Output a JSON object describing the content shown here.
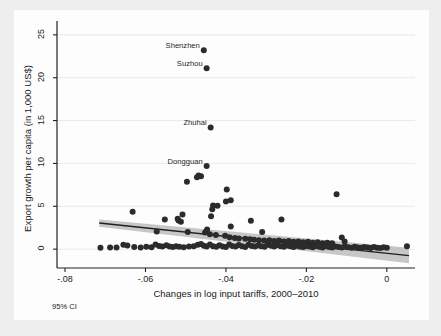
{
  "figure": {
    "background_color": "#eeeeee",
    "canvas_color": "#fdfdfd",
    "note": "95% CI"
  },
  "chart_data": {
    "type": "scatter",
    "title": "",
    "subtitle": "",
    "xlabel": "Changes in log input tariffs, 2000–2010",
    "ylabel": "Export growth per capita (in 1,000 US$)",
    "xlim": [
      -0.082,
      0.007
    ],
    "ylim": [
      -2.2,
      26.5
    ],
    "xticks": [
      -0.08,
      -0.06,
      -0.04,
      -0.02,
      0
    ],
    "xticklabels": [
      "-.08",
      "-.06",
      "-.04",
      "-.02",
      "0"
    ],
    "yticks": [
      0,
      5,
      10,
      15,
      20,
      25
    ],
    "yticklabels": [
      "0",
      "5",
      "10",
      "15",
      "20",
      "25"
    ],
    "grid": "horizontal",
    "legend": "none",
    "marker_color": "#2b2b2b",
    "marker_size": 3.0,
    "fit_line_color": "#1f1f1f",
    "ci_band_color": "#9a9a9a",
    "ci_level": "95% CI",
    "fit_line": {
      "x_start": -0.0715,
      "y_start": 3.05,
      "x_end": 0.0055,
      "y_end": -0.75
    },
    "ci_band": {
      "x_start": -0.0715,
      "upper_start": 3.45,
      "lower_start": 2.6,
      "x_end": 0.0055,
      "upper_end": 0.15,
      "lower_end": -1.65
    },
    "annotations": [
      {
        "label": "Shenzhen",
        "x": -0.0455,
        "y": 23.2
      },
      {
        "label": "Suzhou",
        "x": -0.0448,
        "y": 21.1
      },
      {
        "label": "Zhuhai",
        "x": -0.0438,
        "y": 14.2
      },
      {
        "label": "Dongguan",
        "x": -0.0448,
        "y": 9.7
      }
    ],
    "points": [
      {
        "x": -0.0455,
        "y": 23.2
      },
      {
        "x": -0.0448,
        "y": 21.1
      },
      {
        "x": -0.0438,
        "y": 14.2
      },
      {
        "x": -0.0448,
        "y": 9.7
      },
      {
        "x": -0.0468,
        "y": 8.6
      },
      {
        "x": -0.0472,
        "y": 8.4
      },
      {
        "x": -0.0462,
        "y": 8.5
      },
      {
        "x": -0.0497,
        "y": 7.85
      },
      {
        "x": -0.0398,
        "y": 6.95
      },
      {
        "x": -0.0125,
        "y": 6.4
      },
      {
        "x": -0.0388,
        "y": 5.7
      },
      {
        "x": -0.04,
        "y": 5.55
      },
      {
        "x": -0.0432,
        "y": 5.1
      },
      {
        "x": -0.0421,
        "y": 5.05
      },
      {
        "x": -0.0434,
        "y": 4.65
      },
      {
        "x": -0.0632,
        "y": 4.35
      },
      {
        "x": -0.0508,
        "y": 4.05
      },
      {
        "x": -0.0437,
        "y": 3.85
      },
      {
        "x": -0.0338,
        "y": 3.3
      },
      {
        "x": -0.0262,
        "y": 3.45
      },
      {
        "x": -0.0552,
        "y": 3.45
      },
      {
        "x": -0.0518,
        "y": 3.35
      },
      {
        "x": -0.0512,
        "y": 3.2
      },
      {
        "x": -0.052,
        "y": 3.55
      },
      {
        "x": -0.0388,
        "y": 2.65
      },
      {
        "x": -0.031,
        "y": 2.0
      },
      {
        "x": -0.0572,
        "y": 2.05
      },
      {
        "x": -0.0495,
        "y": 2.0
      },
      {
        "x": -0.0447,
        "y": 2.3
      },
      {
        "x": -0.0452,
        "y": 1.95
      },
      {
        "x": -0.044,
        "y": 1.75
      },
      {
        "x": -0.0425,
        "y": 1.65
      },
      {
        "x": -0.0402,
        "y": 1.55
      },
      {
        "x": -0.0391,
        "y": 1.4
      },
      {
        "x": -0.0378,
        "y": 1.3
      },
      {
        "x": -0.0368,
        "y": 1.25
      },
      {
        "x": -0.0352,
        "y": 1.2
      },
      {
        "x": -0.034,
        "y": 1.15
      },
      {
        "x": -0.033,
        "y": 1.1
      },
      {
        "x": -0.0318,
        "y": 1.05
      },
      {
        "x": -0.0305,
        "y": 1.0
      },
      {
        "x": -0.0292,
        "y": 1.05
      },
      {
        "x": -0.028,
        "y": 0.95
      },
      {
        "x": -0.0268,
        "y": 1.0
      },
      {
        "x": -0.0256,
        "y": 0.9
      },
      {
        "x": -0.0244,
        "y": 0.95
      },
      {
        "x": -0.0232,
        "y": 0.85
      },
      {
        "x": -0.022,
        "y": 0.9
      },
      {
        "x": -0.0208,
        "y": 0.8
      },
      {
        "x": -0.0196,
        "y": 0.85
      },
      {
        "x": -0.0184,
        "y": 0.75
      },
      {
        "x": -0.0172,
        "y": 0.8
      },
      {
        "x": -0.016,
        "y": 0.7
      },
      {
        "x": -0.0148,
        "y": 0.75
      },
      {
        "x": -0.0136,
        "y": 0.7
      },
      {
        "x": -0.0112,
        "y": 1.35
      },
      {
        "x": -0.0105,
        "y": 0.9
      },
      {
        "x": -0.0712,
        "y": 0.15
      },
      {
        "x": -0.0688,
        "y": 0.18
      },
      {
        "x": -0.0672,
        "y": 0.2
      },
      {
        "x": -0.0655,
        "y": 0.5
      },
      {
        "x": -0.0645,
        "y": 0.42
      },
      {
        "x": -0.0628,
        "y": 0.25
      },
      {
        "x": -0.0612,
        "y": 0.2
      },
      {
        "x": -0.0598,
        "y": 0.28
      },
      {
        "x": -0.0585,
        "y": 0.22
      },
      {
        "x": -0.0575,
        "y": 0.55
      },
      {
        "x": -0.0566,
        "y": 0.38
      },
      {
        "x": -0.0558,
        "y": 0.3
      },
      {
        "x": -0.0548,
        "y": 0.45
      },
      {
        "x": -0.054,
        "y": 0.32
      },
      {
        "x": -0.0532,
        "y": 0.25
      },
      {
        "x": -0.0524,
        "y": 0.35
      },
      {
        "x": -0.0516,
        "y": 0.28
      },
      {
        "x": -0.0505,
        "y": 0.22
      },
      {
        "x": -0.0492,
        "y": 0.3
      },
      {
        "x": -0.048,
        "y": 0.35
      },
      {
        "x": -0.047,
        "y": 0.5
      },
      {
        "x": -0.0462,
        "y": 0.6
      },
      {
        "x": -0.0455,
        "y": 0.4
      },
      {
        "x": -0.0448,
        "y": 0.3
      },
      {
        "x": -0.044,
        "y": 0.55
      },
      {
        "x": -0.0432,
        "y": 0.35
      },
      {
        "x": -0.0424,
        "y": 0.28
      },
      {
        "x": -0.0416,
        "y": 0.45
      },
      {
        "x": -0.0408,
        "y": 0.32
      },
      {
        "x": -0.04,
        "y": 0.25
      },
      {
        "x": -0.0392,
        "y": 0.55
      },
      {
        "x": -0.0384,
        "y": 0.38
      },
      {
        "x": -0.0376,
        "y": 0.3
      },
      {
        "x": -0.0368,
        "y": 0.48
      },
      {
        "x": -0.036,
        "y": 0.35
      },
      {
        "x": -0.0352,
        "y": 0.25
      },
      {
        "x": -0.0344,
        "y": 0.52
      },
      {
        "x": -0.0336,
        "y": 0.38
      },
      {
        "x": -0.0328,
        "y": 0.3
      },
      {
        "x": -0.032,
        "y": 0.42
      },
      {
        "x": -0.0312,
        "y": 0.35
      },
      {
        "x": -0.0304,
        "y": 0.28
      },
      {
        "x": -0.0296,
        "y": 0.5
      },
      {
        "x": -0.0288,
        "y": 0.4
      },
      {
        "x": -0.028,
        "y": 0.32
      },
      {
        "x": -0.0272,
        "y": 0.45
      },
      {
        "x": -0.0264,
        "y": 0.35
      },
      {
        "x": -0.0256,
        "y": 0.28
      },
      {
        "x": -0.0248,
        "y": 0.42
      },
      {
        "x": -0.024,
        "y": 0.33
      },
      {
        "x": -0.0232,
        "y": 0.26
      },
      {
        "x": -0.0224,
        "y": 0.4
      },
      {
        "x": -0.0216,
        "y": 0.3
      },
      {
        "x": -0.0208,
        "y": 0.24
      },
      {
        "x": -0.02,
        "y": 0.38
      },
      {
        "x": -0.0192,
        "y": 0.3
      },
      {
        "x": -0.0184,
        "y": 0.22
      },
      {
        "x": -0.0176,
        "y": 0.36
      },
      {
        "x": -0.0168,
        "y": 0.28
      },
      {
        "x": -0.016,
        "y": 0.2
      },
      {
        "x": -0.0152,
        "y": 0.34
      },
      {
        "x": -0.0144,
        "y": 0.26
      },
      {
        "x": -0.0136,
        "y": 0.2
      },
      {
        "x": -0.0128,
        "y": 0.32
      },
      {
        "x": -0.012,
        "y": 0.25
      },
      {
        "x": -0.0112,
        "y": 0.18
      },
      {
        "x": -0.0104,
        "y": 0.3
      },
      {
        "x": -0.0096,
        "y": 0.22
      },
      {
        "x": -0.0088,
        "y": 0.16
      },
      {
        "x": -0.008,
        "y": 0.28
      },
      {
        "x": -0.0072,
        "y": 0.2
      },
      {
        "x": -0.0064,
        "y": 0.15
      },
      {
        "x": -0.0056,
        "y": 0.26
      },
      {
        "x": -0.0048,
        "y": 0.18
      },
      {
        "x": -0.004,
        "y": 0.13
      },
      {
        "x": -0.0032,
        "y": 0.24
      },
      {
        "x": -0.0024,
        "y": 0.17
      },
      {
        "x": -0.0016,
        "y": 0.12
      },
      {
        "x": -0.0008,
        "y": 0.22
      },
      {
        "x": 0.0,
        "y": 0.15
      },
      {
        "x": 0.005,
        "y": 0.35
      }
    ]
  }
}
